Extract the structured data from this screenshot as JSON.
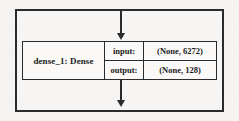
{
  "diagram": {
    "type": "keras-model-layer-block",
    "node": {
      "name_label": "dense_1: Dense",
      "io_rows": [
        {
          "key": "input:",
          "value": "(None, 6272)"
        },
        {
          "key": "output:",
          "value": "(None, 128)"
        }
      ]
    },
    "arrows": [
      {
        "name": "incoming-arrow",
        "direction": "down"
      },
      {
        "name": "outgoing-arrow",
        "direction": "down"
      }
    ],
    "colors": {
      "stroke": "#2b2b2b",
      "text": "#1a1a1a",
      "node_fill": "#fbfaf9",
      "frame_fill": "#f7f6f4",
      "page_background": "#f5f4f2"
    }
  }
}
